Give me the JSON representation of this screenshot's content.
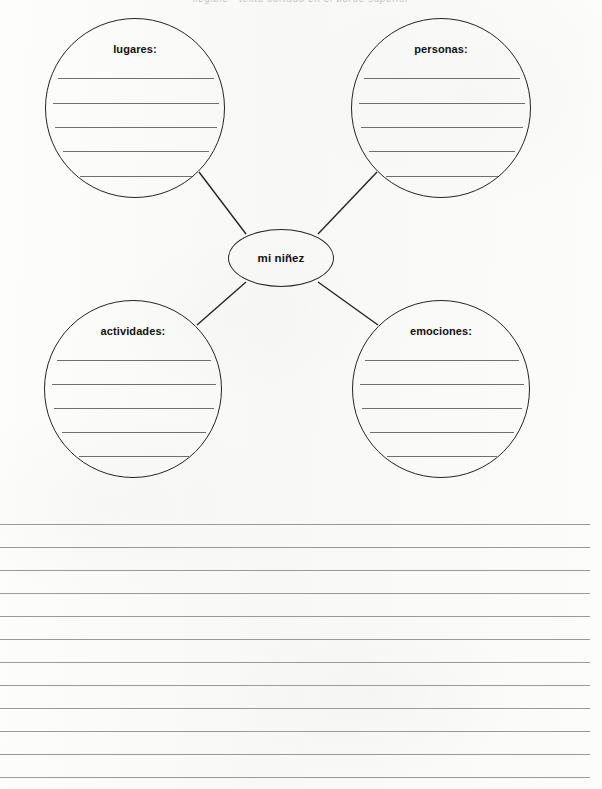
{
  "page": {
    "header_text": "ilegible - texto cortado en el borde superior",
    "background_color": "#fbfbfa",
    "ink_color": "#242424",
    "rule_color": "#9a9a9a"
  },
  "bubble_map": {
    "center": {
      "label": "mi niñez"
    },
    "bubbles": [
      {
        "id": "lugares",
        "label": "lugares:",
        "position": "top-left",
        "cx": 135,
        "cy": 108,
        "r": 90,
        "write_lines": 5
      },
      {
        "id": "personas",
        "label": "personas:",
        "position": "top-right",
        "cx": 441,
        "cy": 108,
        "r": 90,
        "write_lines": 5
      },
      {
        "id": "actividades",
        "label": "actividades:",
        "position": "bottom-left",
        "cx": 133,
        "cy": 389,
        "r": 89,
        "write_lines": 5
      },
      {
        "id": "emociones",
        "label": "emociones:",
        "position": "bottom-right",
        "cx": 441,
        "cy": 389,
        "r": 89,
        "write_lines": 5
      }
    ],
    "connectors": [
      {
        "id": "connector-lugares",
        "x1": 199,
        "y1": 172,
        "x2": 246,
        "y2": 234
      },
      {
        "id": "connector-personas",
        "x1": 377,
        "y1": 172,
        "x2": 318,
        "y2": 234
      },
      {
        "id": "connector-actividades",
        "x1": 197,
        "y1": 325,
        "x2": 246,
        "y2": 282
      },
      {
        "id": "connector-emociones",
        "x1": 378,
        "y1": 325,
        "x2": 318,
        "y2": 282
      }
    ]
  },
  "writing_section": {
    "line_count": 12,
    "first_line_y": 524,
    "line_spacing": 23,
    "line_left": 0,
    "line_right": 590
  }
}
